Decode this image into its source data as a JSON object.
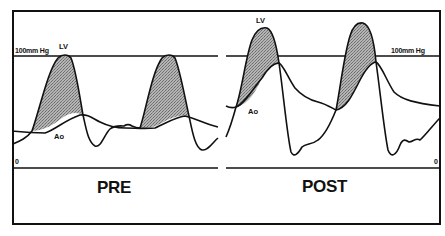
{
  "figure": {
    "panels": [
      {
        "id": "pre",
        "title": "PRE",
        "scale_top_label": "100mm Hg",
        "scale_zero_label": "0",
        "lv_label": "LV",
        "ao_label": "Ao"
      },
      {
        "id": "post",
        "title": "POST",
        "scale_top_label": "100mm Hg",
        "scale_zero_label": "0",
        "lv_label": "LV",
        "ao_label": "Ao"
      }
    ],
    "colors": {
      "line": "#111111",
      "shading": "#9a9a9a",
      "background": "#ffffff"
    }
  }
}
